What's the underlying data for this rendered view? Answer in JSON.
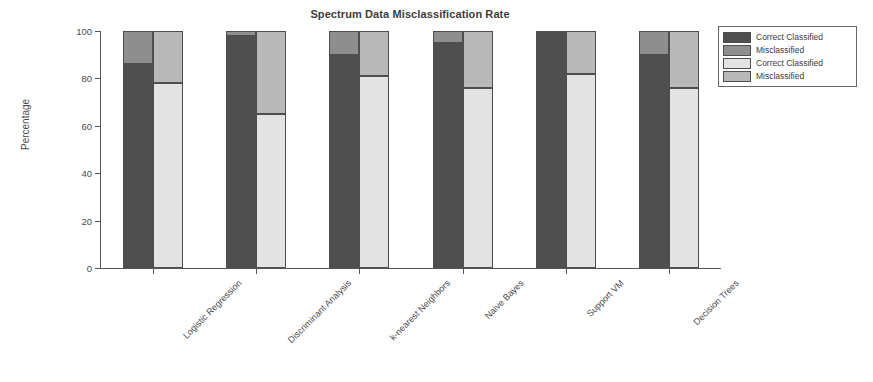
{
  "chart_data": {
    "type": "bar",
    "subtype": "stacked-grouped",
    "title": "Spectrum Data Misclassification Rate",
    "xlabel": "",
    "ylabel": "Percentage",
    "ylim": [
      0,
      100
    ],
    "yticks": [
      0,
      20,
      40,
      60,
      80,
      100
    ],
    "ytick_labels": [
      "0",
      "20",
      "40",
      "60",
      "80",
      "100"
    ],
    "grid": false,
    "legend_position": "outside-right-top",
    "categories": [
      "Logistic Regression",
      "Discriminant Analysis",
      "k-nearest Neighbors",
      "Naive Bayes",
      "Support VM",
      "Decision Trees"
    ],
    "series": [
      {
        "name": "Correct Classified",
        "set": "A",
        "color": "#4f4f4f",
        "values": [
          86,
          98,
          90,
          95,
          100,
          90
        ]
      },
      {
        "name": "Misclassified",
        "set": "A",
        "color": "#8e8e8e",
        "values": [
          14,
          2,
          10,
          5,
          0,
          10
        ]
      },
      {
        "name": "Correct Classified",
        "set": "B",
        "color": "#e3e3e3",
        "values": [
          78,
          65,
          81,
          76,
          82,
          76
        ]
      },
      {
        "name": "Misclassified",
        "set": "B",
        "color": "#b9b9b9",
        "values": [
          22,
          35,
          19,
          24,
          18,
          24
        ]
      }
    ],
    "legend": [
      {
        "label": "Correct Classified",
        "color": "#4f4f4f"
      },
      {
        "label": "Misclassified",
        "color": "#8e8e8e"
      },
      {
        "label": "Correct Classified",
        "color": "#e3e3e3"
      },
      {
        "label": "Misclassified",
        "color": "#b9b9b9"
      }
    ]
  }
}
